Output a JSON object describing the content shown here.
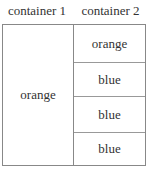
{
  "headers": [
    "container 1",
    "container 2"
  ],
  "container1": {
    "label": "orange"
  },
  "container2": {
    "items": [
      "orange",
      "blue",
      "blue",
      "blue"
    ]
  }
}
